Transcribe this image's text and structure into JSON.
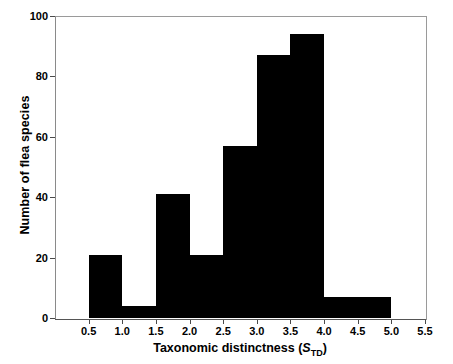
{
  "chart_data": {
    "type": "bar",
    "title": "",
    "subtitle": "",
    "xlabel": "Taxonomic distinctness (STD)",
    "xlabel_main": "Taxonomic distinctness (",
    "xlabel_italic": "S",
    "xlabel_sub": "TD",
    "xlabel_tail": ")",
    "ylabel": "Number of flea species",
    "xlim": [
      0,
      5.5
    ],
    "ylim": [
      0,
      100
    ],
    "grid": false,
    "legend": "none",
    "bin_width": 0.5,
    "categories": [
      "0.5-1.0",
      "1.0-1.5",
      "1.5-2.0",
      "2.0-2.5",
      "2.5-3.0",
      "3.0-3.5",
      "3.5-4.0",
      "4.0-4.5",
      "4.5-5.0"
    ],
    "bins": [
      {
        "start": 0.5,
        "end": 1.0,
        "value": 21
      },
      {
        "start": 1.0,
        "end": 1.5,
        "value": 4
      },
      {
        "start": 1.5,
        "end": 2.0,
        "value": 41
      },
      {
        "start": 2.0,
        "end": 2.5,
        "value": 21
      },
      {
        "start": 2.5,
        "end": 3.0,
        "value": 57
      },
      {
        "start": 3.0,
        "end": 3.5,
        "value": 87
      },
      {
        "start": 3.5,
        "end": 4.0,
        "value": 94
      },
      {
        "start": 4.0,
        "end": 4.5,
        "value": 7
      },
      {
        "start": 4.5,
        "end": 5.0,
        "value": 7
      }
    ],
    "values": [
      21,
      4,
      41,
      21,
      57,
      87,
      94,
      7,
      7
    ],
    "xticks": [
      0.5,
      1.0,
      1.5,
      2.0,
      2.5,
      3.0,
      3.5,
      4.0,
      4.5,
      5.0,
      5.5
    ],
    "xtick_labels": [
      "0.5",
      "1.0",
      "1.5",
      "2.0",
      "2.5",
      "3.0",
      "3.5",
      "4.0",
      "4.5",
      "5.0",
      "5.5"
    ],
    "yticks": [
      0,
      20,
      40,
      60,
      80,
      100
    ],
    "ytick_labels": [
      "0",
      "20",
      "40",
      "60",
      "80",
      "100"
    ],
    "bar_color": "#000000",
    "axis_color": "#8a8a8a",
    "background": "#ffffff"
  }
}
